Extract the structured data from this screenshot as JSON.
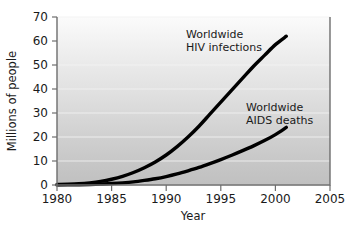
{
  "chart_data": {
    "type": "line",
    "title": "",
    "xlabel": "Year",
    "ylabel": "Millions of people",
    "xlim": [
      1980,
      2005
    ],
    "ylim": [
      0,
      70
    ],
    "grid": true,
    "legend_position": "inline-annotations",
    "x_ticks": [
      "1980",
      "1985",
      "1990",
      "1995",
      "2000",
      "2005"
    ],
    "x_tick_values": [
      1980,
      1985,
      1990,
      1995,
      2000,
      2005
    ],
    "y_ticks": [
      "0",
      "10",
      "20",
      "30",
      "40",
      "50",
      "60",
      "70"
    ],
    "y_tick_values": [
      0,
      10,
      20,
      30,
      40,
      50,
      60,
      70
    ],
    "x": [
      1980,
      1981,
      1982,
      1983,
      1984,
      1985,
      1986,
      1987,
      1988,
      1989,
      1990,
      1991,
      1992,
      1993,
      1994,
      1995,
      1996,
      1997,
      1998,
      1999,
      2000,
      2001
    ],
    "series": [
      {
        "name": "Worldwide HIV infections",
        "label_line1": "Worldwide",
        "label_line2": "HIV infections",
        "color": "#000000",
        "values": [
          0.2,
          0.3,
          0.5,
          0.9,
          1.5,
          2.4,
          3.6,
          5.2,
          7.2,
          9.6,
          12.5,
          16.0,
          20.0,
          24.5,
          29.5,
          34.5,
          39.5,
          44.5,
          49.5,
          54.0,
          58.5,
          62.0
        ]
      },
      {
        "name": "Worldwide AIDS deaths",
        "label_line1": "Worldwide",
        "label_line2": "AIDS deaths",
        "color": "#000000",
        "values": [
          0.05,
          0.08,
          0.12,
          0.2,
          0.35,
          0.6,
          0.9,
          1.3,
          1.9,
          2.6,
          3.5,
          4.6,
          5.9,
          7.3,
          8.9,
          10.6,
          12.4,
          14.3,
          16.3,
          18.5,
          21.0,
          24.0
        ]
      }
    ],
    "annotations": [
      {
        "id": "hiv-annotation",
        "line1": "Worldwide",
        "line2": "HIV infections"
      },
      {
        "id": "aids-annotation",
        "line1": "Worldwide",
        "line2": "AIDS deaths"
      }
    ]
  }
}
